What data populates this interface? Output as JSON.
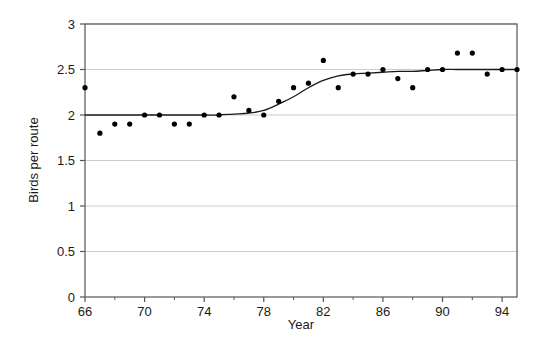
{
  "chart_data": {
    "type": "scatter",
    "title": "",
    "xlabel": "Year",
    "ylabel": "Birds per route",
    "xlim": [
      66,
      95
    ],
    "ylim": [
      0,
      3
    ],
    "xticks": [
      66,
      70,
      74,
      78,
      82,
      86,
      90,
      94
    ],
    "xtick_labels": [
      "66",
      "70",
      "74",
      "78",
      "82",
      "86",
      "90",
      "94"
    ],
    "xminor_ticks": [
      68,
      72,
      76,
      80,
      84,
      88,
      92
    ],
    "yticks": [
      0,
      0.5,
      1,
      1.5,
      2,
      2.5,
      3
    ],
    "ytick_labels": [
      "0",
      "0.5",
      "1",
      "1.5",
      "2",
      "2.5",
      "3"
    ],
    "grid": "horizontal",
    "marker_color": "#000000",
    "line_color": "#1a1a1a",
    "axis_color": "#555555",
    "grid_color": "#cccccc",
    "x": [
      66,
      67,
      68,
      69,
      70,
      71,
      72,
      73,
      74,
      75,
      76,
      77,
      78,
      79,
      80,
      81,
      82,
      83,
      84,
      85,
      86,
      87,
      88,
      89,
      90,
      91,
      92,
      93,
      94,
      95
    ],
    "y": [
      2.3,
      1.8,
      1.9,
      1.9,
      2.0,
      2.0,
      1.9,
      1.9,
      2.0,
      2.0,
      2.2,
      2.05,
      2.0,
      2.15,
      2.3,
      2.35,
      2.6,
      2.3,
      2.45,
      2.45,
      2.5,
      2.4,
      2.3,
      2.5,
      2.5,
      2.68,
      2.68,
      2.45,
      2.5,
      2.5
    ],
    "series": [
      {
        "name": "Observed birds per route",
        "type": "scatter",
        "points": [
          {
            "x": 66,
            "y": 2.3
          },
          {
            "x": 67,
            "y": 1.8
          },
          {
            "x": 68,
            "y": 1.9
          },
          {
            "x": 69,
            "y": 1.9
          },
          {
            "x": 70,
            "y": 2.0
          },
          {
            "x": 71,
            "y": 2.0
          },
          {
            "x": 72,
            "y": 1.9
          },
          {
            "x": 73,
            "y": 1.9
          },
          {
            "x": 74,
            "y": 2.0
          },
          {
            "x": 75,
            "y": 2.0
          },
          {
            "x": 76,
            "y": 2.2
          },
          {
            "x": 77,
            "y": 2.05
          },
          {
            "x": 78,
            "y": 2.0
          },
          {
            "x": 79,
            "y": 2.15
          },
          {
            "x": 80,
            "y": 2.3
          },
          {
            "x": 81,
            "y": 2.35
          },
          {
            "x": 82,
            "y": 2.6
          },
          {
            "x": 83,
            "y": 2.3
          },
          {
            "x": 84,
            "y": 2.45
          },
          {
            "x": 85,
            "y": 2.45
          },
          {
            "x": 86,
            "y": 2.5
          },
          {
            "x": 87,
            "y": 2.4
          },
          {
            "x": 88,
            "y": 2.3
          },
          {
            "x": 89,
            "y": 2.5
          },
          {
            "x": 90,
            "y": 2.5
          },
          {
            "x": 91,
            "y": 2.68
          },
          {
            "x": 92,
            "y": 2.68
          },
          {
            "x": 93,
            "y": 2.45
          },
          {
            "x": 94,
            "y": 2.5
          },
          {
            "x": 95,
            "y": 2.5
          }
        ]
      },
      {
        "name": "Smoothed trend",
        "type": "line",
        "points": [
          {
            "x": 66,
            "y": 2.0
          },
          {
            "x": 68,
            "y": 2.0
          },
          {
            "x": 70,
            "y": 2.0
          },
          {
            "x": 72,
            "y": 2.0
          },
          {
            "x": 74,
            "y": 2.0
          },
          {
            "x": 75,
            "y": 2.0
          },
          {
            "x": 76,
            "y": 2.01
          },
          {
            "x": 77,
            "y": 2.02
          },
          {
            "x": 78,
            "y": 2.05
          },
          {
            "x": 79,
            "y": 2.12
          },
          {
            "x": 80,
            "y": 2.2
          },
          {
            "x": 81,
            "y": 2.3
          },
          {
            "x": 82,
            "y": 2.38
          },
          {
            "x": 83,
            "y": 2.43
          },
          {
            "x": 84,
            "y": 2.45
          },
          {
            "x": 85,
            "y": 2.46
          },
          {
            "x": 86,
            "y": 2.47
          },
          {
            "x": 87,
            "y": 2.48
          },
          {
            "x": 88,
            "y": 2.48
          },
          {
            "x": 89,
            "y": 2.49
          },
          {
            "x": 90,
            "y": 2.5
          },
          {
            "x": 91,
            "y": 2.5
          },
          {
            "x": 92,
            "y": 2.5
          },
          {
            "x": 93,
            "y": 2.5
          },
          {
            "x": 94,
            "y": 2.5
          },
          {
            "x": 95,
            "y": 2.5
          }
        ]
      }
    ]
  },
  "figure": {
    "background": "#ffffff"
  }
}
